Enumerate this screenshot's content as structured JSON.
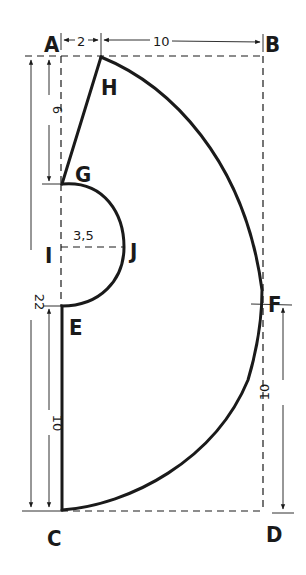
{
  "diagram": {
    "type": "pattern-draft",
    "points": {
      "A": {
        "label": "A",
        "x": 61,
        "y": 56
      },
      "B": {
        "label": "B",
        "x": 263,
        "y": 56
      },
      "C": {
        "label": "C",
        "x": 61,
        "y": 510
      },
      "D": {
        "label": "D",
        "x": 263,
        "y": 510
      },
      "H": {
        "label": "H",
        "x": 101,
        "y": 57
      },
      "G": {
        "label": "G",
        "x": 62,
        "y": 184
      },
      "I": {
        "label": "I",
        "x": 61,
        "y": 247
      },
      "J": {
        "label": "J",
        "x": 124,
        "y": 247
      },
      "E": {
        "label": "E",
        "x": 62,
        "y": 306
      },
      "F": {
        "label": "F",
        "x": 262,
        "y": 305
      }
    },
    "dimensions": {
      "a_to_h": "2",
      "h_to_b": "10",
      "a_to_g": "6",
      "total_height": "22",
      "i_to_j": "3,5",
      "e_to_c": "10",
      "f_to_d": "10"
    },
    "colors": {
      "ink": "#1a1a1a",
      "paper": "#ffffff"
    }
  }
}
